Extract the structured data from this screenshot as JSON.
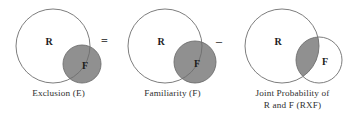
{
  "figure": {
    "background_color": "#ffffff",
    "stroke_color": "#6e6e6e",
    "shade_color": "#909090",
    "label_color": "#1c1c1c",
    "caption_color": "#2f2f2f"
  },
  "panels": [
    {
      "id": "exclusion",
      "caption_lines": [
        "Exclusion (E)"
      ],
      "labels": {
        "big": "R",
        "small": "F"
      },
      "shading": "small-circle-filled",
      "circles": {
        "big": {
          "cx": 53,
          "cy": 46,
          "r": 37
        },
        "small": {
          "cx": 82,
          "cy": 64,
          "r": 19
        }
      },
      "label_positions": {
        "big": {
          "x": 49,
          "y": 43
        },
        "small": {
          "x": 85,
          "y": 67
        }
      }
    },
    {
      "id": "familiarity",
      "caption_lines": [
        "Familiarity (F)"
      ],
      "labels": {
        "big": "R",
        "small": "F"
      },
      "shading": "small-circle-filled",
      "circles": {
        "big": {
          "cx": 51,
          "cy": 46,
          "r": 37
        },
        "small": {
          "cx": 81,
          "cy": 62,
          "r": 21
        }
      },
      "label_positions": {
        "big": {
          "x": 47,
          "y": 43
        },
        "small": {
          "x": 83,
          "y": 65
        }
      }
    },
    {
      "id": "joint",
      "caption_lines": [
        "Joint Probability of",
        "R and F (RXF)"
      ],
      "labels": {
        "big": "R",
        "small": "F"
      },
      "shading": "intersection-only",
      "circles": {
        "big": {
          "cx": 48,
          "cy": 46,
          "r": 37
        },
        "small": {
          "cx": 85,
          "cy": 60,
          "r": 23
        }
      },
      "label_positions": {
        "big": {
          "x": 44,
          "y": 43
        },
        "small": {
          "x": 91,
          "y": 63
        }
      }
    }
  ],
  "operators": [
    {
      "id": "equals",
      "symbol": "="
    },
    {
      "id": "minus",
      "symbol": "–"
    }
  ]
}
